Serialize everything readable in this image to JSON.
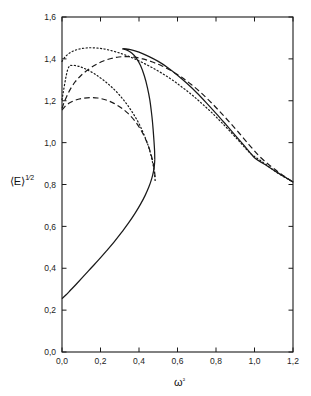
{
  "figure": {
    "name": "mean-energy-vs-omega-squared-plot",
    "background_color": "#ffffff",
    "line_color": "#1a1a1a",
    "frame": {
      "left": 62,
      "right": 293,
      "top": 17,
      "bottom": 352
    }
  },
  "chart_data": {
    "type": "line",
    "title": "",
    "subtitle": "",
    "xlabel": "ω²",
    "ylabel": "⟨E⟩¹ᐟ²",
    "ylabel_parts": {
      "bracket_open": "⟨",
      "symbol": "E",
      "bracket_close": "⟩",
      "exponent_num": "1",
      "exponent_den": "2"
    },
    "xlim": [
      0.0,
      1.2
    ],
    "ylim": [
      0.0,
      1.6
    ],
    "xticks": [
      0.0,
      0.2,
      0.4,
      0.6,
      0.8,
      1.0,
      1.2
    ],
    "yticks": [
      0.0,
      0.2,
      0.4,
      0.6,
      0.8,
      1.0,
      1.2,
      1.4,
      1.6
    ],
    "xtick_labels": [
      "0,0",
      "0,2",
      "0,4",
      "0,6",
      "0,8",
      "1,0",
      "1,2"
    ],
    "ytick_labels": [
      "0,0",
      "0,2",
      "0,4",
      "0,6",
      "0,8",
      "1,0",
      "1,2",
      "1,4",
      "1,6"
    ],
    "decimal_separator": ",",
    "grid": false,
    "legend": null,
    "legend_position": "none",
    "tick_direction": "in",
    "series": [
      {
        "name": "solid-lower-branch",
        "style": "solid",
        "color": "#1a1a1a",
        "points": [
          [
            0.0,
            0.255
          ],
          [
            0.02,
            0.272
          ],
          [
            0.045,
            0.296
          ],
          [
            0.075,
            0.325
          ],
          [
            0.11,
            0.36
          ],
          [
            0.15,
            0.4
          ],
          [
            0.19,
            0.44
          ],
          [
            0.23,
            0.482
          ],
          [
            0.27,
            0.525
          ],
          [
            0.31,
            0.572
          ],
          [
            0.345,
            0.615
          ],
          [
            0.38,
            0.663
          ],
          [
            0.408,
            0.706
          ],
          [
            0.432,
            0.748
          ],
          [
            0.452,
            0.79
          ],
          [
            0.466,
            0.828
          ],
          [
            0.475,
            0.862
          ],
          [
            0.48,
            0.892
          ],
          [
            0.482,
            0.918
          ]
        ]
      },
      {
        "name": "solid-upper-branch",
        "style": "solid",
        "color": "#1a1a1a",
        "points": [
          [
            0.482,
            0.918
          ],
          [
            0.481,
            0.96
          ],
          [
            0.478,
            1.005
          ],
          [
            0.474,
            1.055
          ],
          [
            0.47,
            1.1
          ],
          [
            0.464,
            1.15
          ],
          [
            0.456,
            1.205
          ],
          [
            0.444,
            1.262
          ],
          [
            0.428,
            1.318
          ],
          [
            0.408,
            1.368
          ],
          [
            0.385,
            1.405
          ],
          [
            0.362,
            1.428
          ],
          [
            0.338,
            1.442
          ],
          [
            0.315,
            1.448
          ],
          [
            0.35,
            1.445
          ],
          [
            0.4,
            1.432
          ],
          [
            0.45,
            1.412
          ],
          [
            0.5,
            1.388
          ],
          [
            0.55,
            1.358
          ],
          [
            0.6,
            1.322
          ],
          [
            0.65,
            1.282
          ],
          [
            0.7,
            1.238
          ],
          [
            0.75,
            1.19
          ],
          [
            0.8,
            1.14
          ],
          [
            0.85,
            1.088
          ],
          [
            0.9,
            1.035
          ],
          [
            0.95,
            0.982
          ],
          [
            1.0,
            0.928
          ],
          [
            1.05,
            0.898
          ],
          [
            1.1,
            0.868
          ],
          [
            1.15,
            0.84
          ],
          [
            1.2,
            0.812
          ]
        ]
      },
      {
        "name": "dashed-upper-curve",
        "style": "dashed",
        "color": "#1a1a1a",
        "points": [
          [
            0.0,
            1.163
          ],
          [
            0.01,
            1.19
          ],
          [
            0.025,
            1.222
          ],
          [
            0.045,
            1.258
          ],
          [
            0.07,
            1.292
          ],
          [
            0.1,
            1.322
          ],
          [
            0.135,
            1.348
          ],
          [
            0.175,
            1.372
          ],
          [
            0.215,
            1.39
          ],
          [
            0.255,
            1.402
          ],
          [
            0.295,
            1.409
          ],
          [
            0.335,
            1.411
          ],
          [
            0.375,
            1.408
          ],
          [
            0.42,
            1.4
          ],
          [
            0.47,
            1.385
          ],
          [
            0.52,
            1.366
          ],
          [
            0.57,
            1.342
          ],
          [
            0.62,
            1.313
          ],
          [
            0.67,
            1.279
          ],
          [
            0.72,
            1.24
          ],
          [
            0.77,
            1.196
          ],
          [
            0.82,
            1.148
          ],
          [
            0.87,
            1.098
          ],
          [
            0.92,
            1.046
          ],
          [
            0.97,
            0.992
          ],
          [
            1.02,
            0.94
          ],
          [
            1.07,
            0.898
          ],
          [
            1.12,
            0.862
          ],
          [
            1.16,
            0.836
          ],
          [
            1.2,
            0.812
          ]
        ]
      },
      {
        "name": "dashed-lower-curve",
        "style": "dashed",
        "color": "#1a1a1a",
        "points": [
          [
            0.0,
            1.155
          ],
          [
            0.015,
            1.172
          ],
          [
            0.04,
            1.19
          ],
          [
            0.07,
            1.203
          ],
          [
            0.105,
            1.211
          ],
          [
            0.145,
            1.215
          ],
          [
            0.185,
            1.213
          ],
          [
            0.225,
            1.205
          ],
          [
            0.265,
            1.19
          ],
          [
            0.305,
            1.168
          ],
          [
            0.34,
            1.142
          ],
          [
            0.375,
            1.108
          ],
          [
            0.405,
            1.068
          ],
          [
            0.43,
            1.025
          ],
          [
            0.45,
            0.98
          ],
          [
            0.466,
            0.932
          ],
          [
            0.476,
            0.89
          ],
          [
            0.482,
            0.852
          ],
          [
            0.484,
            0.818
          ]
        ]
      },
      {
        "name": "dotted-upper-curve",
        "style": "dotted",
        "color": "#1a1a1a",
        "points": [
          [
            0.0,
            1.388
          ],
          [
            0.015,
            1.408
          ],
          [
            0.035,
            1.425
          ],
          [
            0.06,
            1.438
          ],
          [
            0.09,
            1.447
          ],
          [
            0.125,
            1.452
          ],
          [
            0.16,
            1.453
          ],
          [
            0.2,
            1.45
          ],
          [
            0.24,
            1.443
          ],
          [
            0.285,
            1.432
          ],
          [
            0.33,
            1.418
          ],
          [
            0.378,
            1.4
          ],
          [
            0.425,
            1.379
          ],
          [
            0.475,
            1.355
          ],
          [
            0.525,
            1.328
          ],
          [
            0.575,
            1.298
          ],
          [
            0.625,
            1.264
          ],
          [
            0.675,
            1.228
          ],
          [
            0.725,
            1.188
          ],
          [
            0.775,
            1.146
          ],
          [
            0.825,
            1.1
          ],
          [
            0.875,
            1.052
          ],
          [
            0.925,
            1.002
          ],
          [
            0.975,
            0.952
          ],
          [
            1.025,
            0.918
          ],
          [
            1.075,
            0.885
          ],
          [
            1.125,
            0.852
          ],
          [
            1.2,
            0.812
          ]
        ]
      },
      {
        "name": "dotted-lower-curve",
        "style": "dotted",
        "color": "#1a1a1a",
        "points": [
          [
            0.0,
            1.205
          ],
          [
            0.03,
            1.35
          ],
          [
            0.06,
            1.368
          ],
          [
            0.095,
            1.362
          ],
          [
            0.13,
            1.348
          ],
          [
            0.17,
            1.328
          ],
          [
            0.21,
            1.302
          ],
          [
            0.25,
            1.272
          ],
          [
            0.29,
            1.236
          ],
          [
            0.33,
            1.192
          ],
          [
            0.365,
            1.146
          ],
          [
            0.398,
            1.094
          ],
          [
            0.425,
            1.04
          ],
          [
            0.448,
            0.985
          ],
          [
            0.464,
            0.932
          ],
          [
            0.475,
            0.885
          ],
          [
            0.481,
            0.848
          ],
          [
            0.484,
            0.818
          ]
        ]
      }
    ],
    "annotations": [
      {
        "label": "turning point (fold)",
        "x": 0.482,
        "y": 0.918
      },
      {
        "label": "solid branch origin",
        "x": 0.0,
        "y": 0.255
      },
      {
        "label": "dotted branch origin",
        "x": 0.0,
        "y": 1.388
      },
      {
        "label": "dashed branch origin",
        "x": 0.0,
        "y": 1.155
      },
      {
        "label": "right endpoint",
        "x": 1.2,
        "y": 0.812
      }
    ]
  }
}
